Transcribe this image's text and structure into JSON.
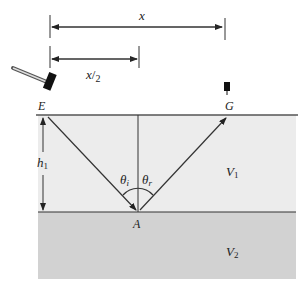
{
  "diagram": {
    "labels": {
      "x": "x",
      "half_x": "x",
      "half_x_den": "2",
      "source": "E",
      "receiver": "G",
      "reflection_point": "A",
      "thickness": "h",
      "thickness_sub": "1",
      "theta_i": "θ",
      "theta_i_sub": "i",
      "theta_r": "θ",
      "theta_r_sub": "r",
      "layer1": "V",
      "layer1_sub": "1",
      "layer2": "V",
      "layer2_sub": "2"
    },
    "icons": {
      "source": "sledgehammer-icon",
      "receiver": "geophone-icon"
    },
    "colors": {
      "layer1": "#ececec",
      "layer2": "#d2d2d2",
      "line": "#333333"
    }
  }
}
